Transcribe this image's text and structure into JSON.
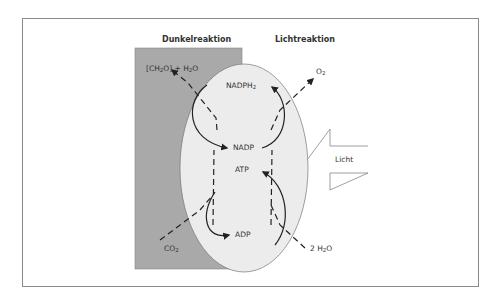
{
  "diagram": {
    "headers": {
      "dark": "Dunkelreaktion",
      "light": "Lichtreaktion"
    },
    "products_dark": {
      "text": "[CH",
      "sub": "2",
      "text2": "O] + H",
      "sub2": "2",
      "text3": "O"
    },
    "product_light": {
      "text": "O",
      "sub": "2"
    },
    "input_dark": {
      "text": "CO",
      "sub": "2"
    },
    "input_light": {
      "text": "2 H",
      "sub": "2",
      "text2": "O"
    },
    "cycle_top": {
      "upper": "NADPH",
      "upper_sub": "2",
      "lower": "NADP"
    },
    "cycle_bottom": {
      "upper": "ATP",
      "lower": "ADP"
    },
    "light_arrow": "Licht",
    "colors": {
      "dark_region": "#a9a9a9",
      "chloroplast": "#ececec",
      "stroke": "#222222"
    }
  }
}
